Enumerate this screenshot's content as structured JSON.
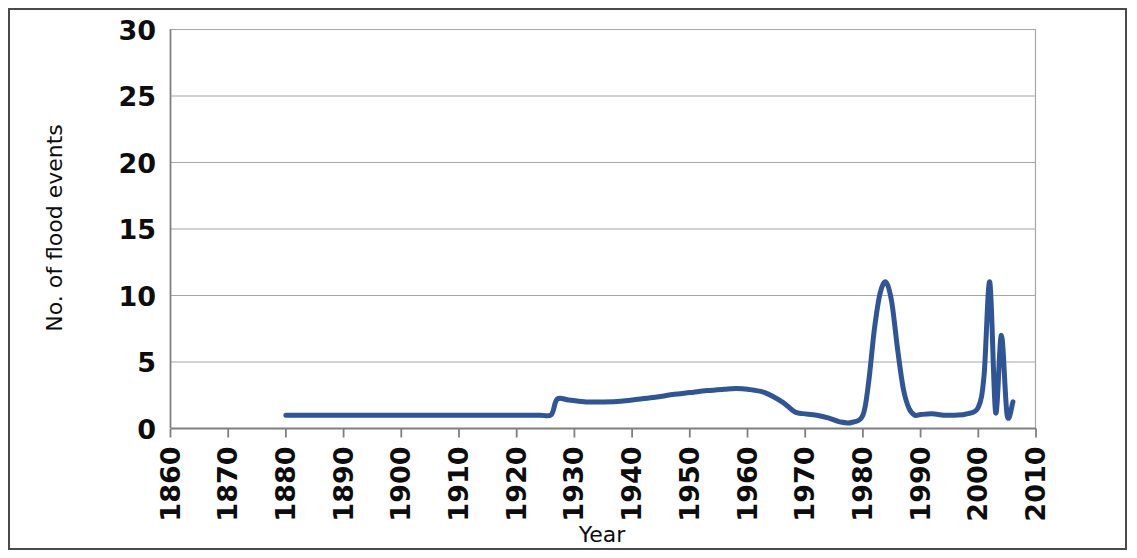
{
  "chart_data": {
    "type": "line",
    "title": "",
    "xlabel": "Year",
    "ylabel": "No. of flood events",
    "xlim": [
      1860,
      2010
    ],
    "ylim": [
      0,
      30
    ],
    "grid": "horizontal",
    "legend": "none",
    "xticks": [
      "1860",
      "1870",
      "1880",
      "1890",
      "1900",
      "1910",
      "1920",
      "1930",
      "1940",
      "1950",
      "1960",
      "1970",
      "1980",
      "1990",
      "2000",
      "2010"
    ],
    "yticks": [
      "0",
      "5",
      "10",
      "15",
      "20",
      "25",
      "30"
    ],
    "series": [
      {
        "name": "No. of flood events",
        "color": "#2F5597",
        "x": [
          1880,
          1885,
          1890,
          1895,
          1900,
          1905,
          1910,
          1915,
          1920,
          1924,
          1926,
          1927,
          1929,
          1932,
          1935,
          1938,
          1941,
          1944,
          1947,
          1950,
          1953,
          1956,
          1958,
          1960,
          1963,
          1966,
          1968,
          1969,
          1970,
          1972,
          1974,
          1976,
          1978,
          1980,
          1981,
          1982,
          1983,
          1984,
          1985,
          1986,
          1987,
          1988,
          1989,
          1990,
          1992,
          1994,
          1996,
          1998,
          2000,
          2001,
          2002,
          2003,
          2004,
          2005,
          2006
        ],
        "y": [
          1.0,
          1.0,
          1.0,
          1.0,
          1.0,
          1.0,
          1.0,
          1.0,
          1.0,
          1.0,
          1.05,
          2.2,
          2.15,
          2.0,
          2.0,
          2.05,
          2.2,
          2.35,
          2.55,
          2.7,
          2.85,
          2.95,
          3.0,
          2.95,
          2.7,
          2.0,
          1.3,
          1.15,
          1.1,
          1.0,
          0.8,
          0.5,
          0.45,
          1.0,
          3.5,
          7.5,
          10.2,
          11.0,
          9.5,
          6.0,
          3.0,
          1.5,
          1.0,
          1.05,
          1.1,
          1.0,
          1.0,
          1.1,
          1.6,
          4.0,
          11.0,
          1.2,
          7.0,
          1.0,
          2.0
        ]
      }
    ]
  },
  "axes": {
    "y_title": "No. of flood events",
    "x_title": "Year"
  }
}
